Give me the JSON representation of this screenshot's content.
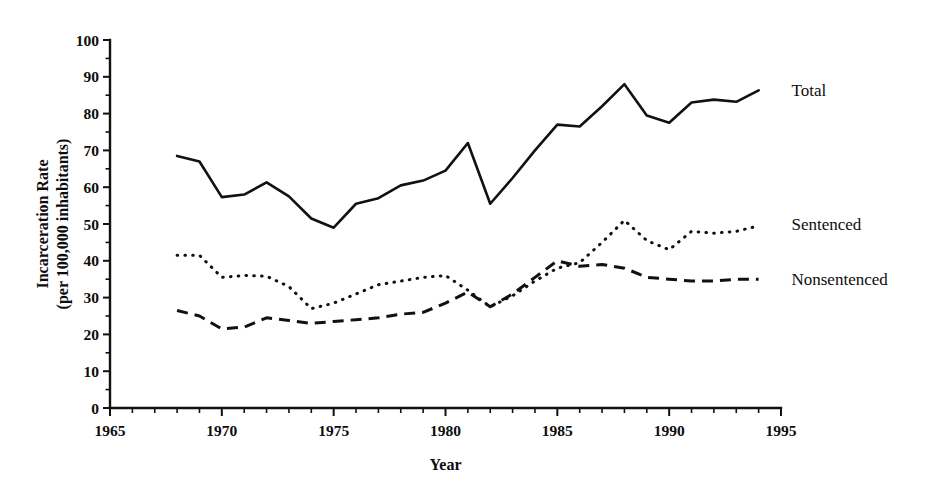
{
  "chart_data": {
    "type": "line",
    "title": "",
    "xlabel": "Year",
    "ylabel": "Incarceration Rate\n(per 100,000 inhabitants)",
    "ylabel_line1": "Incarceration Rate",
    "ylabel_line2": "(per 100,000 inhabitants)",
    "xlim": [
      1965,
      1995
    ],
    "ylim": [
      0,
      100
    ],
    "x_major_ticks": [
      1965,
      1970,
      1975,
      1980,
      1985,
      1990,
      1995
    ],
    "x_major_tick_labels": [
      "1965",
      "1970",
      "1975",
      "1980",
      "1985",
      "1990",
      "1995"
    ],
    "x_minor_tick_step": 1,
    "y_major_ticks": [
      0,
      10,
      20,
      30,
      40,
      50,
      60,
      70,
      80,
      90,
      100
    ],
    "y_major_tick_labels": [
      "0",
      "10",
      "20",
      "30",
      "40",
      "50",
      "60",
      "70",
      "80",
      "90",
      "100"
    ],
    "y_minor_tick_step": 5,
    "grid": false,
    "legend_position": "right-inline-labels",
    "x": [
      1968,
      1969,
      1970,
      1971,
      1972,
      1973,
      1974,
      1975,
      1976,
      1977,
      1978,
      1979,
      1980,
      1981,
      1982,
      1983,
      1984,
      1985,
      1986,
      1987,
      1988,
      1989,
      1990,
      1991,
      1992,
      1993,
      1994
    ],
    "series": [
      {
        "name": "Total",
        "style": "solid",
        "label": "Total",
        "label_x": 1995.2,
        "label_y": 86.5,
        "values": [
          68.5,
          67.0,
          57.3,
          58.0,
          61.3,
          57.5,
          51.5,
          49.0,
          55.5,
          57.0,
          60.5,
          61.8,
          64.5,
          72.0,
          55.5,
          62.5,
          70.0,
          77.0,
          76.5,
          82.0,
          88.0,
          79.5,
          77.5,
          83.0,
          83.8,
          83.2,
          86.3
        ]
      },
      {
        "name": "Sentenced",
        "style": "dotted",
        "label": "Sentenced",
        "label_x": 1995.2,
        "label_y": 50.0,
        "values": [
          41.5,
          41.5,
          35.5,
          36.0,
          35.8,
          33.0,
          27.0,
          28.5,
          31.0,
          33.5,
          34.5,
          35.5,
          36.0,
          32.0,
          27.5,
          30.5,
          34.5,
          38.0,
          39.5,
          45.0,
          51.0,
          45.5,
          43.0,
          48.0,
          47.5,
          48.0,
          49.5
        ]
      },
      {
        "name": "Nonsentenced",
        "style": "dashed",
        "label": "Nonsentenced",
        "label_x": 1995.2,
        "label_y": 35.0,
        "values": [
          26.5,
          25.0,
          21.5,
          22.0,
          24.5,
          23.8,
          23.0,
          23.5,
          24.0,
          24.5,
          25.5,
          26.0,
          28.5,
          31.5,
          27.5,
          31.0,
          35.5,
          40.0,
          38.5,
          39.0,
          38.0,
          35.5,
          35.0,
          34.5,
          34.5,
          35.0,
          35.0
        ]
      }
    ]
  }
}
